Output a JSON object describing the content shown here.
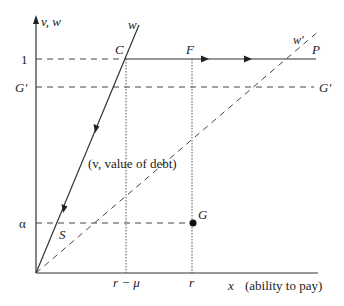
{
  "diagram": {
    "axes": {
      "y_label": "v, w",
      "x_label_var": "x",
      "x_label_desc": "(ability to pay)"
    },
    "y_ticks": {
      "one": "1",
      "g_prime": "G'",
      "alpha": "α"
    },
    "x_ticks": {
      "r_minus_mu": "r − μ",
      "r": "r"
    },
    "points": {
      "C": "C",
      "F": "F",
      "P": "P",
      "G_prime_right": "G'",
      "G": "G",
      "S": "S"
    },
    "curves": {
      "w": "w",
      "w_prime": "w'",
      "value_of_debt": "(v, value of debt)"
    },
    "colors": {
      "line": "#333333",
      "background": "#ffffff"
    }
  }
}
